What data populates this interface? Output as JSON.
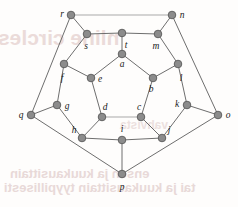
{
  "figure": {
    "width": 238,
    "height": 207,
    "background_color": "#fefdfc"
  },
  "style": {
    "node_fill": "#8c8c8c",
    "node_stroke": "#5a5a5a",
    "node_radius": 3.8,
    "edge_color": "#6e6e6e",
    "edge_light_color": "#a9a9a9",
    "edge_width": 1.0,
    "label_color": "#1a1a1a",
    "label_size": 9.5,
    "watermark_color": "#e8d6d4"
  },
  "watermark": {
    "line1": "nline circles",
    "line2": "ensen ja kuukausittain",
    "line3": "tai ja kuukausittain tyypillisesti",
    "line4": "vahvista"
  },
  "graph": {
    "name": "Dodecahedron graph",
    "vertex_count": 20,
    "edge_count": 30,
    "vertices": [
      {
        "id": "a",
        "x": 122,
        "y": 54,
        "label": "a",
        "label_dx": 0,
        "label_dy": 13
      },
      {
        "id": "b",
        "x": 153,
        "y": 78,
        "label": "b",
        "label_dx": -2,
        "label_dy": 14
      },
      {
        "id": "c",
        "x": 141,
        "y": 117,
        "label": "c",
        "label_dx": -2,
        "label_dy": -7
      },
      {
        "id": "d",
        "x": 102,
        "y": 117,
        "label": "d",
        "label_dx": 3,
        "label_dy": -7
      },
      {
        "id": "e",
        "x": 91,
        "y": 78,
        "label": "e",
        "label_dx": 9,
        "label_dy": 4
      },
      {
        "id": "f",
        "x": 64,
        "y": 64,
        "label": "f",
        "label_dx": -2,
        "label_dy": 17
      },
      {
        "id": "g",
        "x": 57,
        "y": 105,
        "label": "g",
        "label_dx": 10,
        "label_dy": 4
      },
      {
        "id": "h",
        "x": 82,
        "y": 138,
        "label": "h",
        "label_dx": -8,
        "label_dy": -5
      },
      {
        "id": "i",
        "x": 122,
        "y": 140,
        "label": "i",
        "label_dx": 0,
        "label_dy": -8
      },
      {
        "id": "j",
        "x": 162,
        "y": 138,
        "label": "j",
        "label_dx": 7,
        "label_dy": -5
      },
      {
        "id": "k",
        "x": 187,
        "y": 105,
        "label": "k",
        "label_dx": -10,
        "label_dy": 2
      },
      {
        "id": "l",
        "x": 178,
        "y": 64,
        "label": "l",
        "label_dx": 3,
        "label_dy": 17
      },
      {
        "id": "m",
        "x": 158,
        "y": 34,
        "label": "m",
        "label_dx": -2,
        "label_dy": 15
      },
      {
        "id": "n",
        "x": 172,
        "y": 15,
        "label": "n",
        "label_dx": 10,
        "label_dy": 3
      },
      {
        "id": "o",
        "x": 218,
        "y": 115,
        "label": "o",
        "label_dx": 10,
        "label_dy": 3
      },
      {
        "id": "p",
        "x": 122,
        "y": 174,
        "label": "p",
        "label_dx": 0,
        "label_dy": 16
      },
      {
        "id": "q",
        "x": 31,
        "y": 115,
        "label": "q",
        "label_dx": -10,
        "label_dy": 3
      },
      {
        "id": "r",
        "x": 71,
        "y": 15,
        "label": "r",
        "label_dx": -9,
        "label_dy": 2
      },
      {
        "id": "s",
        "x": 87,
        "y": 34,
        "label": "s",
        "label_dx": -1,
        "label_dy": 15
      },
      {
        "id": "t",
        "x": 122,
        "y": 33,
        "label": "t",
        "label_dx": 4,
        "label_dy": 15
      }
    ],
    "edges": [
      {
        "from": "a",
        "to": "b",
        "tone": "normal"
      },
      {
        "from": "b",
        "to": "c",
        "tone": "normal"
      },
      {
        "from": "c",
        "to": "d",
        "tone": "light"
      },
      {
        "from": "d",
        "to": "e",
        "tone": "normal"
      },
      {
        "from": "e",
        "to": "a",
        "tone": "normal"
      },
      {
        "from": "a",
        "to": "t",
        "tone": "normal"
      },
      {
        "from": "b",
        "to": "l",
        "tone": "normal"
      },
      {
        "from": "c",
        "to": "j",
        "tone": "normal"
      },
      {
        "from": "d",
        "to": "h",
        "tone": "normal"
      },
      {
        "from": "e",
        "to": "f",
        "tone": "normal"
      },
      {
        "from": "f",
        "to": "s",
        "tone": "normal"
      },
      {
        "from": "s",
        "to": "t",
        "tone": "normal"
      },
      {
        "from": "t",
        "to": "m",
        "tone": "normal"
      },
      {
        "from": "m",
        "to": "l",
        "tone": "normal"
      },
      {
        "from": "l",
        "to": "k",
        "tone": "normal"
      },
      {
        "from": "k",
        "to": "j",
        "tone": "normal"
      },
      {
        "from": "j",
        "to": "i",
        "tone": "normal"
      },
      {
        "from": "i",
        "to": "h",
        "tone": "normal"
      },
      {
        "from": "h",
        "to": "g",
        "tone": "normal"
      },
      {
        "from": "g",
        "to": "f",
        "tone": "normal"
      },
      {
        "from": "s",
        "to": "r",
        "tone": "normal"
      },
      {
        "from": "m",
        "to": "n",
        "tone": "normal"
      },
      {
        "from": "k",
        "to": "o",
        "tone": "normal"
      },
      {
        "from": "i",
        "to": "p",
        "tone": "normal"
      },
      {
        "from": "g",
        "to": "q",
        "tone": "normal"
      },
      {
        "from": "r",
        "to": "n",
        "tone": "light"
      },
      {
        "from": "n",
        "to": "o",
        "tone": "normal"
      },
      {
        "from": "o",
        "to": "p",
        "tone": "normal"
      },
      {
        "from": "p",
        "to": "q",
        "tone": "normal"
      },
      {
        "from": "q",
        "to": "r",
        "tone": "normal"
      }
    ]
  }
}
